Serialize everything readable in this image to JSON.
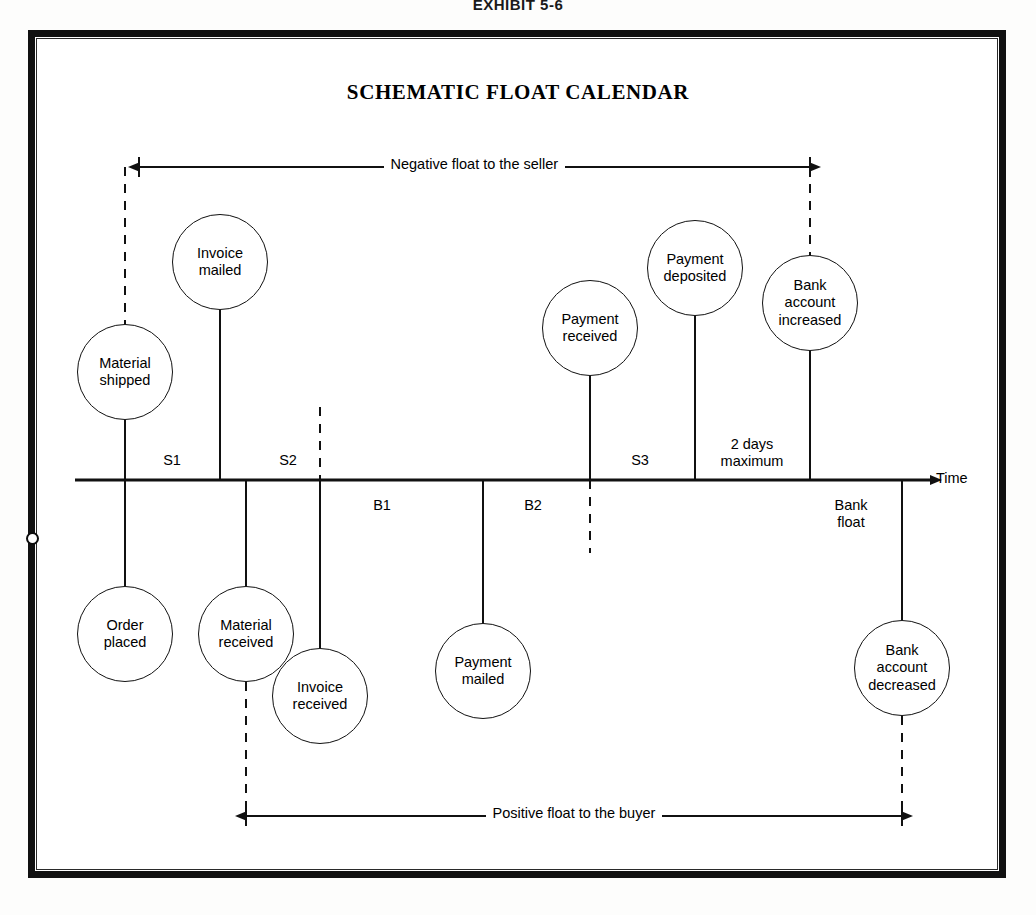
{
  "exhibit": {
    "label": "EXHIBIT 5-6"
  },
  "diagram": {
    "title": "SCHEMATIC FLOAT CALENDAR",
    "type": "timeline-schematic",
    "axis": {
      "end_label": "Time",
      "y": 480,
      "x_start": 75,
      "x_end": 930
    },
    "float_bands": [
      {
        "id": "negative-float",
        "label": "Negative float to the seller",
        "side": "above",
        "from_x": 139,
        "to_x": 810,
        "y": 167
      },
      {
        "id": "positive-float",
        "label": "Positive float to the buyer",
        "side": "below",
        "from_x": 246,
        "to_x": 902,
        "y": 816
      }
    ],
    "segments": [
      {
        "id": "s1",
        "label": "S1",
        "side": "above",
        "x": 172,
        "y": 452
      },
      {
        "id": "s2",
        "label": "S2",
        "side": "above",
        "x": 288,
        "y": 452
      },
      {
        "id": "s3",
        "label": "S3",
        "side": "above",
        "x": 640,
        "y": 452
      },
      {
        "id": "two-days",
        "label": "2 days\nmaximum",
        "side": "above",
        "x": 752,
        "y": 436
      },
      {
        "id": "b1",
        "label": "B1",
        "side": "below",
        "x": 382,
        "y": 497
      },
      {
        "id": "b2",
        "label": "B2",
        "side": "below",
        "x": 533,
        "y": 497
      },
      {
        "id": "bank-float",
        "label": "Bank\nfloat",
        "side": "below",
        "x": 851,
        "y": 497
      }
    ],
    "events_above": [
      {
        "id": "material-shipped",
        "label": "Material\nshipped",
        "cx": 125,
        "cy": 372,
        "r": 48,
        "stem_x": 125,
        "stem_top": 420,
        "stem_bottom": 480,
        "dashed_from_y": 167
      },
      {
        "id": "invoice-mailed",
        "label": "Invoice\nmailed",
        "cx": 220,
        "cy": 262,
        "r": 48,
        "stem_x": 220,
        "stem_top": 310,
        "stem_bottom": 480
      },
      {
        "id": "payment-received",
        "label": "Payment\nreceived",
        "cx": 590,
        "cy": 328,
        "r": 48,
        "stem_x": 590,
        "stem_top": 376,
        "stem_bottom": 480
      },
      {
        "id": "payment-deposited",
        "label": "Payment\ndeposited",
        "cx": 695,
        "cy": 268,
        "r": 48,
        "stem_x": 695,
        "stem_top": 316,
        "stem_bottom": 480
      },
      {
        "id": "bank-account-increased",
        "label": "Bank\naccount\nincreased",
        "cx": 810,
        "cy": 303,
        "r": 48,
        "stem_x": 810,
        "stem_top": 351,
        "stem_bottom": 480,
        "dashed_from_y": 167
      }
    ],
    "events_below": [
      {
        "id": "order-placed",
        "label": "Order\nplaced",
        "cx": 125,
        "cy": 634,
        "r": 48,
        "stem_x": 125,
        "stem_top": 480,
        "stem_bottom": 586
      },
      {
        "id": "material-received",
        "label": "Material\nreceived",
        "cx": 246,
        "cy": 634,
        "r": 48,
        "stem_x": 246,
        "stem_top": 480,
        "stem_bottom": 586,
        "dashed_to_y": 816
      },
      {
        "id": "invoice-received",
        "label": "Invoice\nreceived",
        "cx": 320,
        "cy": 696,
        "r": 48,
        "stem_x": 320,
        "stem_top": 480,
        "stem_bottom": 648
      },
      {
        "id": "payment-mailed",
        "label": "Payment\nmailed",
        "cx": 483,
        "cy": 671,
        "r": 48,
        "stem_x": 483,
        "stem_top": 480,
        "stem_bottom": 623
      },
      {
        "id": "bank-account-decreased",
        "label": "Bank\naccount\ndecreased",
        "cx": 902,
        "cy": 668,
        "r": 48,
        "stem_x": 902,
        "stem_top": 480,
        "stem_bottom": 620,
        "dashed_to_y": 816
      }
    ],
    "dashed_markers": [
      {
        "id": "marker-invoice-received",
        "x": 320,
        "from_y": 407,
        "to_y": 553
      },
      {
        "id": "marker-payment-received",
        "x": 590,
        "from_y": 480,
        "to_y": 553
      }
    ],
    "colors": {
      "ink": "#111111",
      "paper": "#ffffff",
      "frame": "#111111"
    }
  }
}
